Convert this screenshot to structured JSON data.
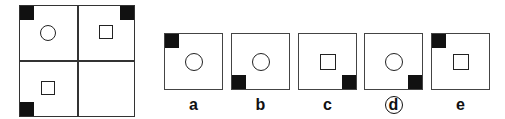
{
  "puzzle": {
    "grid": {
      "cells": [
        {
          "position": "top-left",
          "shape": "circle",
          "corner_block": "top-left"
        },
        {
          "position": "top-right",
          "shape": "square",
          "corner_block": "top-right"
        },
        {
          "position": "bottom-left",
          "shape": "square",
          "corner_block": "bottom-left"
        },
        {
          "position": "bottom-right",
          "shape": "empty",
          "corner_block": "none"
        }
      ]
    },
    "options": [
      {
        "label": "a",
        "shape": "circle",
        "corner_block": "top-left",
        "selected": false
      },
      {
        "label": "b",
        "shape": "circle",
        "corner_block": "bottom-left",
        "selected": false
      },
      {
        "label": "c",
        "shape": "square",
        "corner_block": "bottom-right",
        "selected": false
      },
      {
        "label": "d",
        "shape": "circle",
        "corner_block": "bottom-right",
        "selected": true
      },
      {
        "label": "e",
        "shape": "square",
        "corner_block": "top-left",
        "selected": false
      }
    ]
  }
}
